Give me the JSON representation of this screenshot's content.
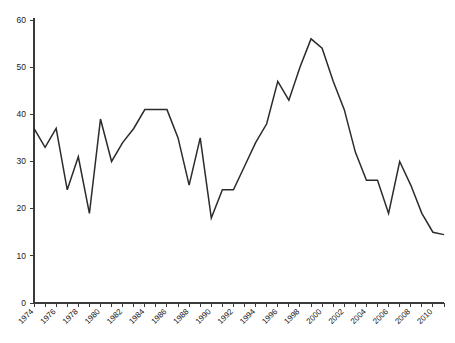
{
  "chart_data": {
    "type": "line",
    "title": "",
    "subtitle": "",
    "xlabel": "",
    "ylabel": "",
    "grid": false,
    "legend": false,
    "legend_position": "none",
    "line_color": "#2b2b2b",
    "axis_color": "#3a3a3a",
    "background_color": "#ffffff",
    "xlim": [
      1974,
      2011
    ],
    "ylim": [
      0,
      60
    ],
    "y_ticks": [
      0,
      10,
      20,
      30,
      40,
      50,
      60
    ],
    "y_tick_labels": [
      "0",
      "10",
      "20",
      "30",
      "40",
      "50",
      "60"
    ],
    "x_tick_labels": [
      "1974",
      "1976",
      "1978",
      "1980",
      "1982",
      "1984",
      "1986",
      "1988",
      "1990",
      "1992",
      "1994",
      "1996",
      "1998",
      "2000",
      "2002",
      "2004",
      "2006",
      "2008",
      "2010"
    ],
    "x_tick_label_interval": 2,
    "x_minor_tick_interval": 1,
    "x": [
      1974,
      1975,
      1976,
      1977,
      1978,
      1979,
      1980,
      1981,
      1982,
      1983,
      1984,
      1985,
      1986,
      1987,
      1988,
      1989,
      1990,
      1991,
      1992,
      1993,
      1994,
      1995,
      1996,
      1997,
      1998,
      1999,
      2000,
      2001,
      2002,
      2003,
      2004,
      2005,
      2006,
      2007,
      2008,
      2009,
      2010,
      2011
    ],
    "values": [
      37,
      33,
      37,
      24,
      31,
      19,
      39,
      30,
      34,
      37,
      41,
      41,
      41,
      35,
      25,
      35,
      18,
      24,
      24,
      29,
      34,
      38,
      47,
      43,
      50,
      56,
      54,
      47,
      41,
      32,
      26,
      26,
      19,
      30,
      25,
      19,
      15,
      14.5
    ],
    "series": [
      {
        "name": "",
        "values": [
          37,
          33,
          37,
          24,
          31,
          19,
          39,
          30,
          34,
          37,
          41,
          41,
          41,
          35,
          25,
          35,
          18,
          24,
          24,
          29,
          34,
          38,
          47,
          43,
          50,
          56,
          54,
          47,
          41,
          32,
          26,
          26,
          19,
          30,
          25,
          19,
          15,
          14.5
        ]
      }
    ]
  }
}
